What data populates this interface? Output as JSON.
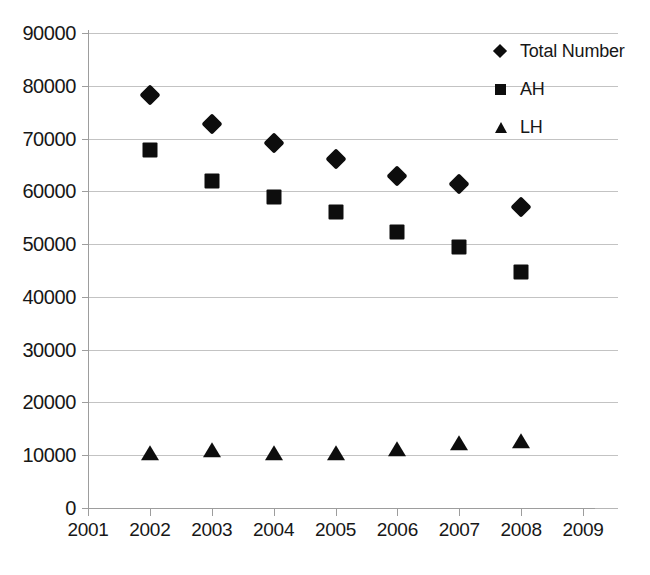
{
  "chart_data": {
    "type": "scatter",
    "title": "",
    "subtitle": "",
    "xlabel": "",
    "ylabel": "",
    "xlim": [
      2001,
      2009
    ],
    "ylim": [
      0,
      90000
    ],
    "grid": true,
    "legend_position": "top-right",
    "x": [
      2002,
      2003,
      2004,
      2005,
      2006,
      2007,
      2008
    ],
    "x_tick_labels": [
      "2001",
      "2002",
      "2003",
      "2004",
      "2005",
      "2006",
      "2007",
      "2008",
      "2009"
    ],
    "x_ticks": [
      2001,
      2002,
      2003,
      2004,
      2005,
      2006,
      2007,
      2008,
      2009
    ],
    "y_tick_labels": [
      "90000",
      "80000",
      "70000",
      "60000",
      "50000",
      "40000",
      "30000",
      "20000",
      "10000",
      "0"
    ],
    "y_ticks": [
      90000,
      80000,
      70000,
      60000,
      50000,
      40000,
      30000,
      20000,
      10000,
      0
    ],
    "series": [
      {
        "name": "Total Number",
        "marker": "diamond",
        "color": "#0d0d0d",
        "values": [
          78200,
          72700,
          69200,
          66100,
          62900,
          61300,
          57000
        ]
      },
      {
        "name": "AH",
        "marker": "square",
        "color": "#0d0d0d",
        "values": [
          67800,
          61900,
          59000,
          56000,
          52300,
          49500,
          44800
        ]
      },
      {
        "name": "LH",
        "marker": "triangle",
        "color": "#0d0d0d",
        "values": [
          10300,
          10800,
          10300,
          10200,
          11000,
          12100,
          12500
        ]
      }
    ]
  },
  "legend": {
    "items": [
      {
        "label": "Total Number",
        "marker": "diamond"
      },
      {
        "label": "AH",
        "marker": "square"
      },
      {
        "label": "LH",
        "marker": "triangle"
      }
    ]
  }
}
